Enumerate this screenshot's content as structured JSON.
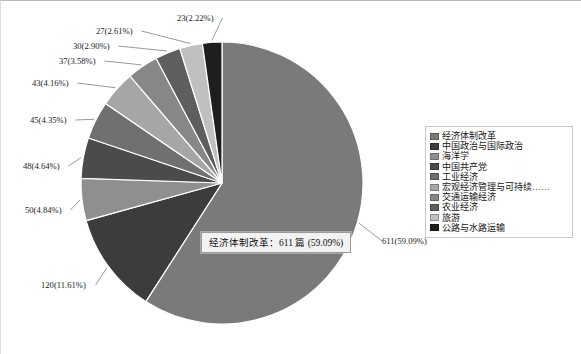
{
  "chart_data": {
    "type": "pie",
    "title": "",
    "subtitle": "",
    "xlabel": "",
    "ylabel": "",
    "legend_position": "right",
    "grid": false,
    "unit_label": "篇",
    "total": 1034,
    "categories": [
      "经济体制改革",
      "中国政治与国际政治",
      "海洋学",
      "中国共产党",
      "工业经济",
      "宏观经济管理与可持续……",
      "交通运输经济",
      "农业经济",
      "旅游",
      "公路与水路运输"
    ],
    "values": [
      611,
      120,
      50,
      48,
      45,
      43,
      37,
      30,
      27,
      23
    ],
    "percents": [
      59.09,
      11.61,
      4.84,
      4.64,
      4.35,
      4.16,
      3.58,
      2.9,
      2.61,
      2.22
    ],
    "colors": [
      "#7a7a7a",
      "#3c3c3c",
      "#8f8f8f",
      "#4b4b4b",
      "#707070",
      "#a6a6a6",
      "#878787",
      "#5e5e5e",
      "#c0c0c0",
      "#1e1e1e"
    ],
    "data_labels": [
      "611(59.09%)",
      "120(11.61%)",
      "50(4.84%)",
      "48(4.64%)",
      "45(4.35%)",
      "43(4.16%)",
      "37(3.58%)",
      "30(2.90%)",
      "27(2.61%)",
      "23(2.22%)"
    ]
  },
  "legend": {
    "items": [
      {
        "label": "经济体制改革",
        "color": "#7a7a7a"
      },
      {
        "label": "中国政治与国际政治",
        "color": "#3c3c3c"
      },
      {
        "label": "海洋学",
        "color": "#8f8f8f"
      },
      {
        "label": "中国共产党",
        "color": "#4b4b4b"
      },
      {
        "label": "工业经济",
        "color": "#707070"
      },
      {
        "label": "宏观经济管理与可持续……",
        "color": "#a6a6a6"
      },
      {
        "label": "交通运输经济",
        "color": "#878787"
      },
      {
        "label": "农业经济",
        "color": "#5e5e5e"
      },
      {
        "label": "旅游",
        "color": "#c0c0c0"
      },
      {
        "label": "公路与水路运输",
        "color": "#1e1e1e"
      }
    ]
  },
  "tooltip": {
    "text": "经济体制改革：611 篇 (59.09%)"
  }
}
